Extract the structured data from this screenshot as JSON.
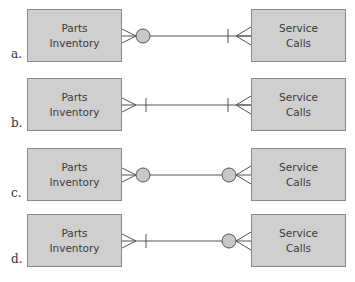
{
  "diagram": {
    "type": "entity-relationship options",
    "colors": {
      "entity_fill": "#cfcfcf",
      "entity_border": "#8a8a8a",
      "line": "#555555",
      "circle_fill": "#c8c8c8"
    },
    "options": [
      {
        "label": "a.",
        "left_entity": {
          "line1": "Parts",
          "line2": "Inventory"
        },
        "right_entity": {
          "line1": "Service",
          "line2": "Calls"
        },
        "left_end": "crows-foot-circle",
        "right_end": "tick-crows-foot"
      },
      {
        "label": "b.",
        "left_entity": {
          "line1": "Parts",
          "line2": "Inventory"
        },
        "right_entity": {
          "line1": "Service",
          "line2": "Calls"
        },
        "left_end": "crows-foot-tick",
        "right_end": "tick-crows-foot"
      },
      {
        "label": "c.",
        "left_entity": {
          "line1": "Parts",
          "line2": "Inventory"
        },
        "right_entity": {
          "line1": "Service",
          "line2": "Calls"
        },
        "left_end": "crows-foot-circle",
        "right_end": "circle-crows-foot"
      },
      {
        "label": "d.",
        "left_entity": {
          "line1": "Parts",
          "line2": "Inventory"
        },
        "right_entity": {
          "line1": "Service",
          "line2": "Calls"
        },
        "left_end": "crows-foot-tick",
        "right_end": "circle-crows-foot"
      }
    ]
  }
}
